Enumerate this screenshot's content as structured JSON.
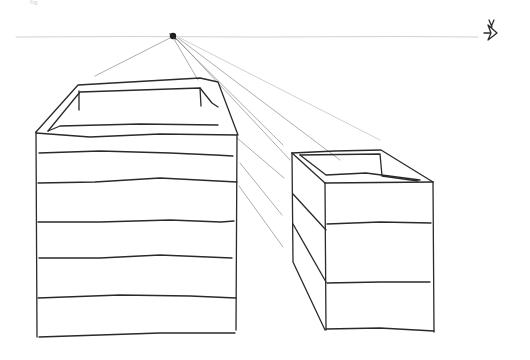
{
  "figure": {
    "corner_label": "fig",
    "colors": {
      "background": "#ffffff",
      "ink": "#2a2a2a",
      "guide": "#8a8a8a",
      "horizon": "#bdbdbd"
    },
    "horizon_y": 37,
    "vanishing_point": {
      "x": 173,
      "y": 37
    },
    "eye_symbol": {
      "x": 490,
      "y": 32
    },
    "left_box": {
      "front_face": {
        "x1": 35,
        "y1": 130,
        "x2": 237,
        "y2": 337
      },
      "bands": 6
    },
    "right_box": {
      "front_face": {
        "x1": 323,
        "y1": 180,
        "x2": 433,
        "y2": 330
      },
      "bands": 3
    }
  }
}
